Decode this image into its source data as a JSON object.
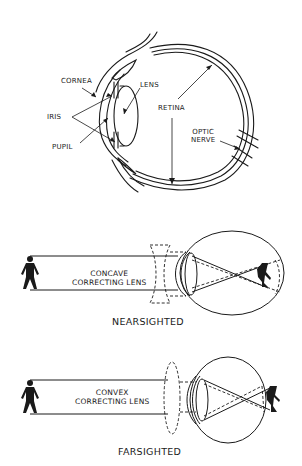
{
  "anatomy": {
    "labels": {
      "cornea": "CORNEA",
      "iris": "IRIS",
      "pupil": "PUPIL",
      "lens": "LENS",
      "retina": "RETINA",
      "optic_nerve_line1": "OPTIC",
      "optic_nerve_line2": "NERVE"
    }
  },
  "nearsighted": {
    "lens_label_line1": "CONCAVE",
    "lens_label_line2": "CORRECTING LENS",
    "caption": "NEARSIGHTED"
  },
  "farsighted": {
    "lens_label_line1": "CONVEX",
    "lens_label_line2": "CORRECTING LENS",
    "caption": "FARSIGHTED"
  },
  "colors": {
    "ink": "#1a1a1a",
    "background": "#ffffff"
  }
}
